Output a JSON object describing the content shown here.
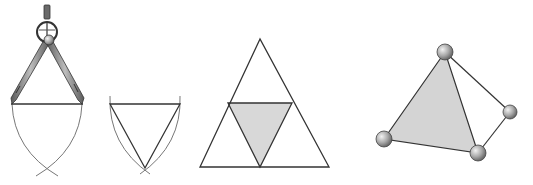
{
  "figure": {
    "panels": [
      {
        "id": "compass-construction",
        "label": ""
      },
      {
        "id": "equilateral-triangle",
        "label": ""
      },
      {
        "id": "subdivided-triangle",
        "label": ""
      },
      {
        "id": "tetrahedron",
        "label": ""
      }
    ],
    "colors": {
      "line": "#333333",
      "arc": "#777777",
      "shade": "#d8d8d8",
      "metal": "#8a8a8a",
      "sphere": "#9a9a9a"
    }
  }
}
